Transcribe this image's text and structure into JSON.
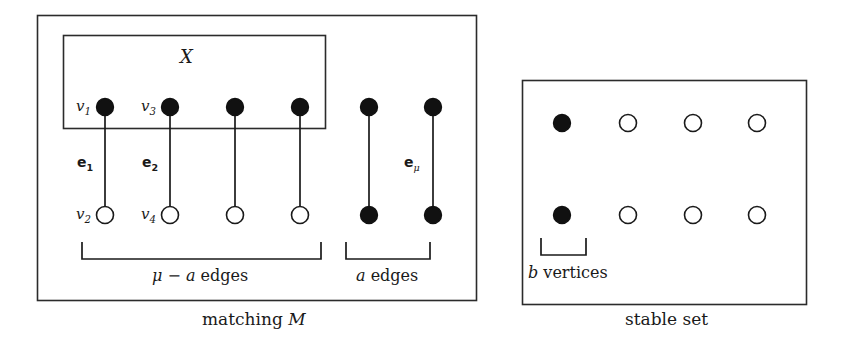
{
  "figure": {
    "stroke_color": "#2b2b2b",
    "fill_color": "#111111",
    "background": "#ffffff"
  },
  "left_panel": {
    "caption": "matching M",
    "inner_box_label": "X",
    "top_row_vertices": [
      {
        "label": "v1",
        "filled": true,
        "x": 105,
        "y": 107
      },
      {
        "label": "v3",
        "filled": true,
        "x": 170,
        "y": 107
      },
      {
        "label": "",
        "filled": true,
        "x": 235,
        "y": 107
      },
      {
        "label": "",
        "filled": true,
        "x": 300,
        "y": 107
      },
      {
        "label": "",
        "filled": true,
        "x": 369,
        "y": 107
      },
      {
        "label": "",
        "filled": true,
        "x": 433,
        "y": 107
      }
    ],
    "bottom_row_vertices": [
      {
        "label": "v2",
        "filled": false,
        "x": 105,
        "y": 215
      },
      {
        "label": "v4",
        "filled": false,
        "x": 170,
        "y": 215
      },
      {
        "label": "",
        "filled": false,
        "x": 235,
        "y": 215
      },
      {
        "label": "",
        "filled": false,
        "x": 300,
        "y": 215
      },
      {
        "label": "",
        "filled": true,
        "x": 369,
        "y": 215
      },
      {
        "label": "",
        "filled": true,
        "x": 433,
        "y": 215
      }
    ],
    "edge_labels": [
      {
        "text": "e",
        "sub": "1",
        "x": 78,
        "y": 158
      },
      {
        "text": "e",
        "sub": "2",
        "x": 143,
        "y": 158
      },
      {
        "text": "e",
        "sub": "μ",
        "x": 403,
        "y": 158
      }
    ],
    "vertex_labels": [
      {
        "text": "v",
        "sub": "1",
        "x": 76,
        "y": 100
      },
      {
        "text": "v",
        "sub": "3",
        "x": 141,
        "y": 100
      },
      {
        "text": "v",
        "sub": "2",
        "x": 76,
        "y": 208
      },
      {
        "text": "v",
        "sub": "4",
        "x": 141,
        "y": 208
      }
    ],
    "brackets": [
      {
        "name": "mu-minus-a-edges",
        "label": "μ − a edges",
        "x1": 82,
        "x2": 321,
        "y": 242,
        "depth": 17
      },
      {
        "name": "a-edges",
        "label": "a edges",
        "x1": 346,
        "x2": 430,
        "y": 242,
        "depth": 17
      }
    ]
  },
  "right_panel": {
    "caption": "stable set",
    "top_row_vertices": [
      {
        "filled": true,
        "x": 562,
        "y": 123
      },
      {
        "filled": false,
        "x": 628,
        "y": 123
      },
      {
        "filled": false,
        "x": 693,
        "y": 123
      },
      {
        "filled": false,
        "x": 757,
        "y": 123
      }
    ],
    "bottom_row_vertices": [
      {
        "filled": true,
        "x": 562,
        "y": 215
      },
      {
        "filled": false,
        "x": 628,
        "y": 215
      },
      {
        "filled": false,
        "x": 693,
        "y": 215
      },
      {
        "filled": false,
        "x": 757,
        "y": 215
      }
    ],
    "bracket": {
      "name": "b-vertices",
      "label": "b vertices",
      "x1": 541,
      "x2": 586,
      "y": 238,
      "depth": 17
    }
  },
  "math_symbols": {
    "mu": "μ",
    "minus": "−",
    "a": "a",
    "b": "b",
    "M": "M",
    "X": "X"
  }
}
